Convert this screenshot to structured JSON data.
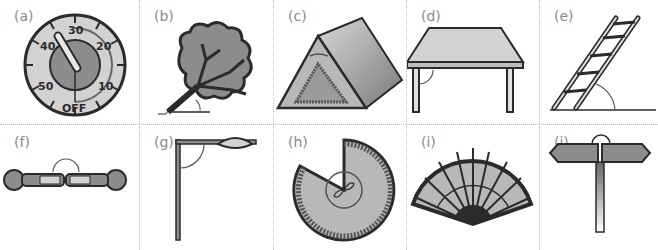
{
  "figure": {
    "top_cut_text": "energy picture diagram",
    "panels": [
      {
        "id": "a",
        "label": "(a)",
        "object": "oven timer",
        "icon": "timer-icon",
        "dial_numbers": [
          "30",
          "20",
          "10",
          "OFF",
          "50",
          "40"
        ]
      },
      {
        "id": "b",
        "label": "(b)",
        "object": "leaning tree",
        "icon": "tree-icon"
      },
      {
        "id": "c",
        "label": "(c)",
        "object": "tent",
        "icon": "tent-icon"
      },
      {
        "id": "d",
        "label": "(d)",
        "object": "table",
        "icon": "table-icon"
      },
      {
        "id": "e",
        "label": "(e)",
        "object": "ladder against ground",
        "icon": "ladder-icon"
      },
      {
        "id": "f",
        "label": "(f)",
        "object": "two people lying feet to feet",
        "icon": "people-icon"
      },
      {
        "id": "g",
        "label": "(g)",
        "object": "street lamp",
        "icon": "street-lamp-icon"
      },
      {
        "id": "h",
        "label": "(h)",
        "object": "cut pie/cake",
        "icon": "pie-icon"
      },
      {
        "id": "i",
        "label": "(i)",
        "object": "hand fan",
        "icon": "fan-icon"
      },
      {
        "id": "j",
        "label": "(j)",
        "object": "signpost",
        "icon": "signpost-icon"
      }
    ]
  },
  "colors": {
    "dark": "#2b2b2b",
    "mid": "#8c8c8c",
    "light": "#d2d2d2",
    "label": "#8a8a8a",
    "divider": "#bbbbbb"
  }
}
